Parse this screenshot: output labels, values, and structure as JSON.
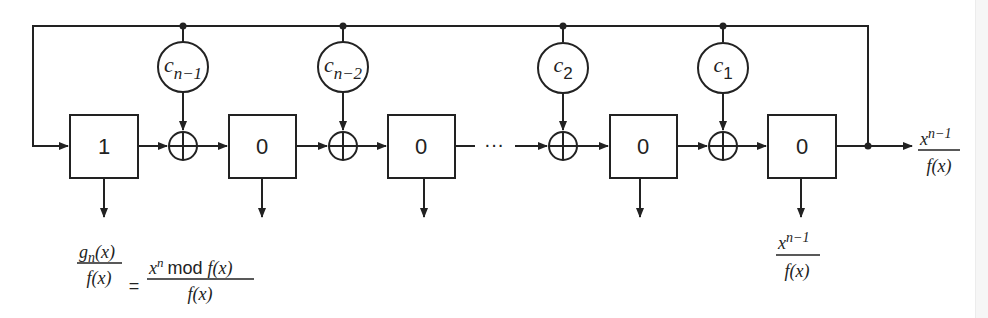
{
  "diagram": {
    "type": "lfsr-division-circuit",
    "registers": [
      {
        "id": "r1",
        "value": "1"
      },
      {
        "id": "r2",
        "value": "0"
      },
      {
        "id": "r3",
        "value": "0"
      },
      {
        "id": "r4",
        "value": "0"
      },
      {
        "id": "r5",
        "value": "0"
      }
    ],
    "coefficients": [
      {
        "base": "c",
        "sub": "n−1"
      },
      {
        "base": "c",
        "sub": "n−2"
      },
      {
        "base": "c",
        "sub": "2"
      },
      {
        "base": "c",
        "sub": "1"
      }
    ],
    "ellipsis": "···",
    "output_label": {
      "num_base": "x",
      "num_sup": "n−1",
      "den": "f(x)"
    },
    "bottom_left_label": {
      "lhs_num_base": "g",
      "lhs_num_sub": "n",
      "lhs_num_tail": "(x)",
      "lhs_den": "f(x)",
      "equals": "=",
      "rhs_num_base": "x",
      "rhs_num_sup": "n",
      "rhs_num_mod": "mod",
      "rhs_num_tail": "f(x)",
      "rhs_den": "f(x)"
    },
    "bottom_right_label": {
      "num_base": "x",
      "num_sup": "n−1",
      "den": "f(x)"
    },
    "colors": {
      "stroke": "#222222",
      "background": "#ffffff"
    }
  }
}
